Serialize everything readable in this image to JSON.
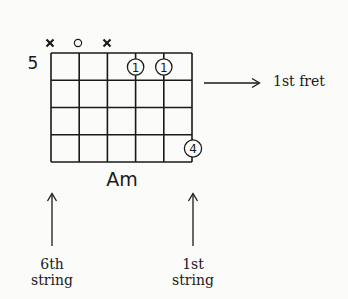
{
  "chord": {
    "name": "Am",
    "position_fret": "5",
    "strings": 6,
    "frets_shown": 4,
    "string_markers": [
      {
        "string": 6,
        "symbol": "×",
        "meaning": "muted"
      },
      {
        "string": 5,
        "symbol": "○",
        "meaning": "open"
      },
      {
        "string": 4,
        "symbol": "×",
        "meaning": "muted"
      }
    ],
    "fingerings": [
      {
        "string": 3,
        "fret_row": 1,
        "finger": "1"
      },
      {
        "string": 2,
        "fret_row": 1,
        "finger": "1"
      },
      {
        "string": 1,
        "fret_row": 4,
        "finger": "4"
      }
    ]
  },
  "annotations": {
    "fret_label": "1st fret",
    "sixth_string_label_line1": "6th",
    "sixth_string_label_line2": "string",
    "first_string_label_line1": "1st",
    "first_string_label_line2": "string"
  },
  "colors": {
    "ink": "#1a1a1a",
    "background": "#fbfbfa"
  }
}
